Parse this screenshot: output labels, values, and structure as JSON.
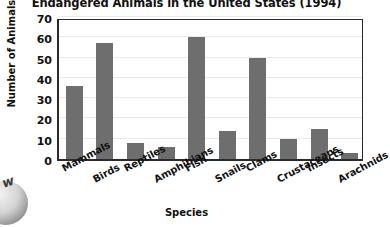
{
  "chart_data": {
    "type": "bar",
    "title": "Endangered Animals in the United States (1994)",
    "xlabel": "Species",
    "ylabel": "Number of Animals",
    "categories": [
      "Mammals",
      "Birds",
      "Reptiles",
      "Amphibians",
      "Fish",
      "Snails",
      "Clams",
      "Crustaceans",
      "Insects",
      "Arachnids"
    ],
    "values": [
      36,
      57,
      8,
      6,
      60,
      14,
      50,
      10,
      15,
      3
    ],
    "ylim": [
      0,
      70
    ],
    "yticks": [
      0,
      10,
      20,
      30,
      40,
      50,
      60,
      70
    ],
    "ytick_labels": [
      "0",
      "10",
      "20",
      "30",
      "40",
      "50",
      "60",
      "70"
    ],
    "grid": true,
    "legend": false,
    "bar_color": "#6e6e6e",
    "axis_color": "#2b2b2b",
    "grid_color": "#e9e9e9",
    "background": "#ffffff"
  },
  "watermark": {
    "glyph": "w"
  }
}
